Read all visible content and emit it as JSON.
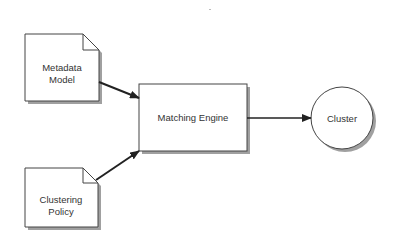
{
  "diagram": {
    "nodes": [
      {
        "id": "metadata_model",
        "shape": "document",
        "lines": [
          "Metadata",
          "Model"
        ]
      },
      {
        "id": "clustering_policy",
        "shape": "document",
        "lines": [
          "Clustering",
          "Policy"
        ]
      },
      {
        "id": "matching_engine",
        "shape": "rectangle",
        "lines": [
          "Matching Engine"
        ]
      },
      {
        "id": "cluster",
        "shape": "circle",
        "lines": [
          "Cluster"
        ]
      }
    ],
    "edges": [
      {
        "from": "metadata_model",
        "to": "matching_engine"
      },
      {
        "from": "clustering_policy",
        "to": "matching_engine"
      },
      {
        "from": "matching_engine",
        "to": "cluster"
      }
    ],
    "colors": {
      "stroke": "#444444",
      "shadow": "#9a9a9a",
      "fill": "#ffffff",
      "text": "#333333"
    }
  }
}
